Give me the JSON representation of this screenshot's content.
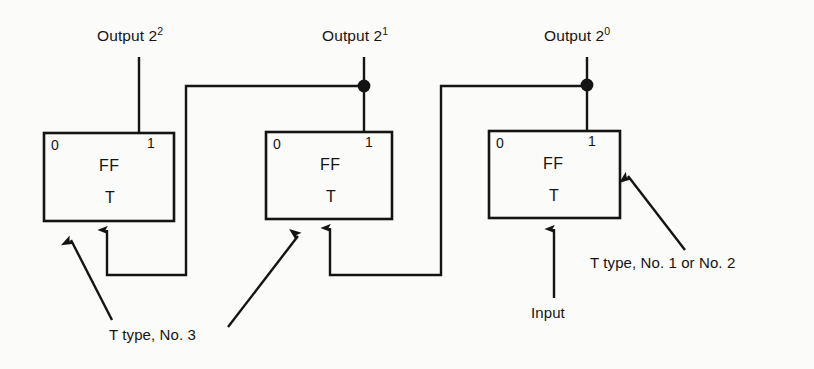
{
  "diagram": {
    "ink_color": "#141414",
    "paper_color": "#fbfbf9"
  },
  "outputs": [
    {
      "id": "output-2-2",
      "text_prefix": "Output 2",
      "exponent": "2",
      "x": 97,
      "y": 28,
      "line_x": 139,
      "has_junction_dot": false
    },
    {
      "id": "output-2-1",
      "text_prefix": "Output 2",
      "exponent": "1",
      "x": 322,
      "y": 28,
      "line_x": 364,
      "has_junction_dot": true
    },
    {
      "id": "output-2-0",
      "text_prefix": "Output 2",
      "exponent": "0",
      "x": 544,
      "y": 28,
      "line_x": 587,
      "has_junction_dot": true
    }
  ],
  "flipflops": [
    {
      "id": "ff-stage-2",
      "stage_label": "2^2",
      "pin_left": "0",
      "pin_right": "1",
      "body_label": "FF",
      "type_label": "T",
      "x": 44,
      "y": 133,
      "width": 130,
      "height": 88
    },
    {
      "id": "ff-stage-1",
      "stage_label": "2^1",
      "pin_left": "0",
      "pin_right": "1",
      "body_label": "FF",
      "type_label": "T",
      "x": 266,
      "y": 132,
      "width": 126,
      "height": 87
    },
    {
      "id": "ff-stage-0",
      "stage_label": "2^0",
      "pin_left": "0",
      "pin_right": "1",
      "body_label": "FF",
      "type_label": "T",
      "x": 489,
      "y": 131,
      "width": 131,
      "height": 87
    }
  ],
  "annotations": [
    {
      "id": "annot-t-type-no-3",
      "text": "T type, No. 3",
      "x": 109,
      "y": 327
    },
    {
      "id": "annot-input",
      "text": "Input",
      "x": 531,
      "y": 305
    },
    {
      "id": "annot-t-type-no-1-or-no-2",
      "text": "T type, No. 1 or No. 2",
      "x": 590,
      "y": 255
    }
  ],
  "signals": {
    "input_label": "Input",
    "input_line_x": 554,
    "input_line_bottom_y": 298,
    "feedback_bus_y": 86,
    "feedback_return_y": 275
  }
}
